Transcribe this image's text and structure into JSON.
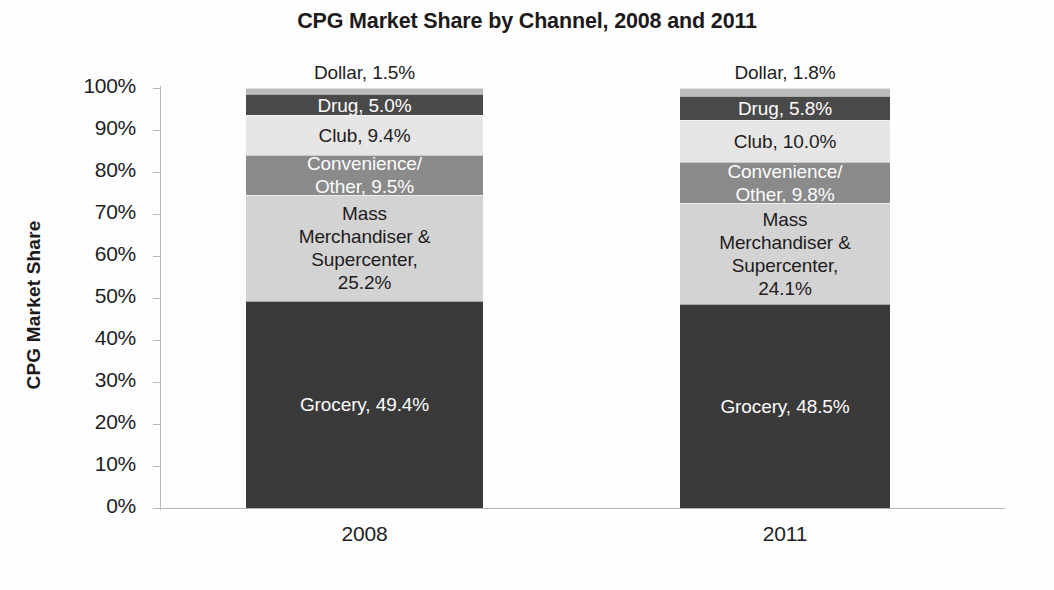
{
  "chart_data": {
    "type": "bar",
    "subtype": "stacked-100-percent",
    "title": "CPG Market Share by Channel, 2008 and 2011",
    "subtitle": "",
    "xlabel": "",
    "ylabel": "CPG Market Share",
    "categories": [
      "2008",
      "2011"
    ],
    "ylim": [
      0,
      100
    ],
    "ytick_labels": [
      "100%",
      "90%",
      "80%",
      "70%",
      "60%",
      "50%",
      "40%",
      "30%",
      "20%",
      "10%",
      "0%"
    ],
    "ytick_values": [
      100,
      90,
      80,
      70,
      60,
      50,
      40,
      30,
      20,
      10,
      0
    ],
    "grid": false,
    "legend": "none",
    "value_suffix": "%",
    "stack_order_bottom_to_top": [
      "Grocery",
      "Mass Merchandiser & Supercenter",
      "Convenience/Other",
      "Club",
      "Drug",
      "Dollar"
    ],
    "series": [
      {
        "name": "Grocery",
        "values": [
          49.4,
          48.5
        ],
        "color": "#3b3a3a",
        "label_color": "light",
        "labels": [
          "Grocery, 49.4%",
          "Grocery, 48.5%"
        ],
        "label_position": "inside"
      },
      {
        "name": "Mass Merchandiser & Supercenter",
        "values": [
          25.2,
          24.1
        ],
        "color": "#d4d4d4",
        "label_color": "dark",
        "labels": [
          "Mass\nMerchandiser &\nSupercenter,\n25.2%",
          "Mass\nMerchandiser &\nSupercenter,\n24.1%"
        ],
        "label_position": "inside"
      },
      {
        "name": "Convenience/Other",
        "values": [
          9.5,
          9.8
        ],
        "color": "#8b8b8b",
        "label_color": "light",
        "labels": [
          "Convenience/\nOther, 9.5%",
          "Convenience/\nOther, 9.8%"
        ],
        "label_position": "inside"
      },
      {
        "name": "Club",
        "values": [
          9.4,
          10.0
        ],
        "color": "#e7e7e7",
        "label_color": "dark",
        "labels": [
          "Club, 9.4%",
          "Club, 10.0%"
        ],
        "label_position": "inside"
      },
      {
        "name": "Drug",
        "values": [
          5.0,
          5.8
        ],
        "color": "#4b4a4a",
        "label_color": "light",
        "labels": [
          "Drug, 5.0%",
          "Drug, 5.8%"
        ],
        "label_position": "inside"
      },
      {
        "name": "Dollar",
        "values": [
          1.5,
          1.8
        ],
        "color": "#bdbdbd",
        "label_color": "dark",
        "labels": [
          "Dollar, 1.5%",
          "Dollar, 1.8%"
        ],
        "label_position": "outside-above"
      }
    ]
  },
  "axis": {
    "y_title": "CPG Market Share",
    "ticks": [
      {
        "label": "100%",
        "value": 100
      },
      {
        "label": "90%",
        "value": 90
      },
      {
        "label": "80%",
        "value": 80
      },
      {
        "label": "70%",
        "value": 70
      },
      {
        "label": "60%",
        "value": 60
      },
      {
        "label": "50%",
        "value": 50
      },
      {
        "label": "40%",
        "value": 40
      },
      {
        "label": "30%",
        "value": 30
      },
      {
        "label": "20%",
        "value": 20
      },
      {
        "label": "10%",
        "value": 10
      },
      {
        "label": "0%",
        "value": 0
      }
    ]
  },
  "bars": [
    {
      "category": "2008",
      "outside_label": "Dollar, 1.5%",
      "segments": [
        {
          "name": "Dollar",
          "value": 1.5,
          "label": "",
          "color": "#bdbdbd",
          "text": "dark"
        },
        {
          "name": "Drug",
          "value": 5.0,
          "label": "Drug, 5.0%",
          "color": "#4b4a4a",
          "text": "light"
        },
        {
          "name": "Club",
          "value": 9.4,
          "label": "Club, 9.4%",
          "color": "#e7e7e7",
          "text": "dark"
        },
        {
          "name": "Convenience/Other",
          "value": 9.5,
          "label": "Convenience/\nOther, 9.5%",
          "color": "#8b8b8b",
          "text": "light"
        },
        {
          "name": "Mass Merchandiser & Supercenter",
          "value": 25.2,
          "label": "Mass\nMerchandiser &\nSupercenter,\n25.2%",
          "color": "#d4d4d4",
          "text": "dark"
        },
        {
          "name": "Grocery",
          "value": 49.4,
          "label": "Grocery, 49.4%",
          "color": "#3b3a3a",
          "text": "light"
        }
      ]
    },
    {
      "category": "2011",
      "outside_label": "Dollar, 1.8%",
      "segments": [
        {
          "name": "Dollar",
          "value": 1.8,
          "label": "",
          "color": "#bdbdbd",
          "text": "dark"
        },
        {
          "name": "Drug",
          "value": 5.8,
          "label": "Drug, 5.8%",
          "color": "#4b4a4a",
          "text": "light"
        },
        {
          "name": "Club",
          "value": 10.0,
          "label": "Club, 10.0%",
          "color": "#e7e7e7",
          "text": "dark"
        },
        {
          "name": "Convenience/Other",
          "value": 9.8,
          "label": "Convenience/\nOther, 9.8%",
          "color": "#8b8b8b",
          "text": "light"
        },
        {
          "name": "Mass Merchandiser & Supercenter",
          "value": 24.1,
          "label": "Mass\nMerchandiser &\nSupercenter,\n24.1%",
          "color": "#d4d4d4",
          "text": "dark"
        },
        {
          "name": "Grocery",
          "value": 48.5,
          "label": "Grocery, 48.5%",
          "color": "#3b3a3a",
          "text": "light"
        }
      ]
    }
  ],
  "layout": {
    "plot_left": 160,
    "plot_top": 88,
    "plot_height": 420,
    "bar_geometry": [
      {
        "left": 246,
        "width": 237
      },
      {
        "left": 680,
        "width": 210
      }
    ],
    "category_label_geometry": [
      {
        "left": 246,
        "width": 237
      },
      {
        "left": 680,
        "width": 210
      }
    ]
  }
}
